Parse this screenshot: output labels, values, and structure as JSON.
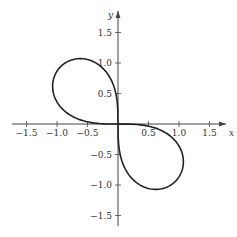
{
  "chart_data": {
    "type": "line",
    "title": "",
    "xlabel": "x",
    "ylabel": "y",
    "xlim": [
      -1.75,
      1.9
    ],
    "ylim": [
      -1.8,
      1.9
    ],
    "grid": false,
    "legend": null,
    "x_ticks": [
      -1.5,
      -1.0,
      -0.5,
      0.5,
      1.0,
      1.5
    ],
    "x_tick_labels": [
      "−1.5",
      "−1.0",
      "−0.5",
      "0.5",
      "1.0",
      "1.5"
    ],
    "y_ticks": [
      1.5,
      1.0,
      0.5,
      -0.5,
      -1.0,
      -1.5
    ],
    "y_tick_labels": [
      "1.5",
      "1.0",
      "0.5",
      "−0.5",
      "−1.0",
      "−1.5"
    ],
    "series": [
      {
        "name": "curve",
        "description": "Two-lobed closed curve through the origin, lobes in quadrants II and IV, tangent to both axes at origin",
        "points": [
          [
            0,
            0
          ],
          [
            -0.05,
            0.6
          ],
          [
            -0.25,
            1.0
          ],
          [
            -0.65,
            1.15
          ],
          [
            -1.0,
            0.95
          ],
          [
            -1.15,
            0.6
          ],
          [
            -1.0,
            0.25
          ],
          [
            -0.6,
            0.05
          ],
          [
            0,
            0
          ],
          [
            0.05,
            -0.6
          ],
          [
            0.25,
            -1.0
          ],
          [
            0.65,
            -1.15
          ],
          [
            1.0,
            -0.95
          ],
          [
            1.15,
            -0.6
          ],
          [
            1.0,
            -0.25
          ],
          [
            0.6,
            -0.05
          ],
          [
            0,
            0
          ]
        ]
      }
    ]
  },
  "axes": {
    "x_label": "x",
    "y_label": "y"
  }
}
